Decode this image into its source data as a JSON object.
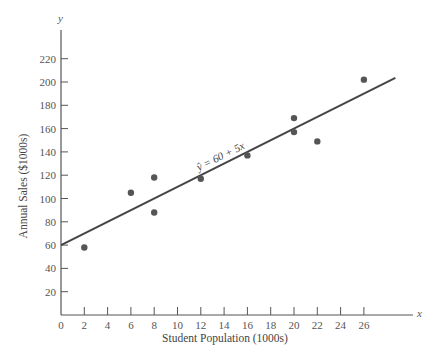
{
  "chart_data": {
    "type": "scatter",
    "title": "",
    "xlabel": "Student Population (1000s)",
    "ylabel": "Annual Sales ($1000s)",
    "x_axis_var": "x",
    "y_axis_var": "y",
    "xlim": [
      0,
      30
    ],
    "ylim": [
      0,
      230
    ],
    "xticks": [
      0,
      2,
      4,
      6,
      8,
      10,
      12,
      14,
      16,
      18,
      20,
      22,
      24,
      26
    ],
    "yticks": [
      20,
      40,
      60,
      80,
      100,
      120,
      140,
      160,
      180,
      200,
      220
    ],
    "grid": false,
    "legend": null,
    "series": [
      {
        "name": "Observations",
        "type": "scatter",
        "points": [
          {
            "x": 2,
            "y": 58
          },
          {
            "x": 6,
            "y": 105
          },
          {
            "x": 8,
            "y": 88
          },
          {
            "x": 8,
            "y": 118
          },
          {
            "x": 12,
            "y": 117
          },
          {
            "x": 16,
            "y": 137
          },
          {
            "x": 20,
            "y": 157
          },
          {
            "x": 20,
            "y": 169
          },
          {
            "x": 22,
            "y": 149
          },
          {
            "x": 26,
            "y": 202
          }
        ]
      },
      {
        "name": "Regression line",
        "type": "line",
        "intercept": 60,
        "slope": 5,
        "x_range": [
          0,
          29
        ]
      }
    ],
    "annotations": [
      {
        "text": "ŷ = 60 + 5x",
        "x": 14,
        "y": 130,
        "rotation_deg": -26
      }
    ]
  },
  "colors": {
    "axis": "#555555",
    "points": "#555555",
    "line": "#444444",
    "text": "#555555"
  }
}
